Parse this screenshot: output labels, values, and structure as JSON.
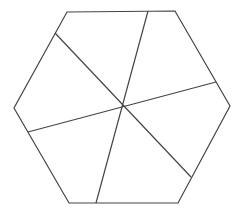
{
  "diagram": {
    "type": "hexagon-dissection",
    "stroke_color": "#444444",
    "background": "#ffffff",
    "stroke_width": 1.2,
    "center": [
      123,
      106
    ],
    "hexagon": {
      "vertices": [
        [
          67,
          12
        ],
        [
          175,
          11
        ],
        [
          230,
          106
        ],
        [
          178,
          203
        ],
        [
          69,
          203
        ],
        [
          14,
          108
        ]
      ]
    },
    "cuts": [
      {
        "name": "cut-line-1",
        "from": [
          148,
          11
        ],
        "to": [
          96,
          203
        ]
      },
      {
        "name": "cut-line-2",
        "from": [
          55,
          33
        ],
        "to": [
          191,
          177
        ]
      },
      {
        "name": "cut-line-3",
        "from": [
          216,
          82
        ],
        "to": [
          28,
          132
        ]
      }
    ]
  }
}
